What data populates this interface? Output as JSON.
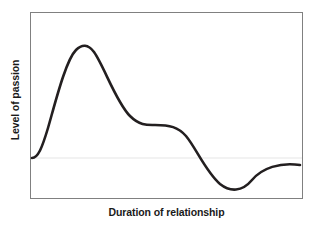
{
  "chart_data": {
    "type": "line",
    "title": "",
    "subtitle": "",
    "xlabel": "Duration of relationship",
    "ylabel": "Level of passion",
    "legend": [],
    "legend_position": "none",
    "grid": true,
    "gridlines": {
      "horizontal": [
        {
          "label": "",
          "value": 0,
          "y_pixel": 158,
          "color": "#e6e6e6",
          "description": "faint baseline reference line at the curve's starting level"
        }
      ],
      "vertical": []
    },
    "axes": {
      "x_ticks": [],
      "y_ticks": [],
      "x_tick_labels": [],
      "y_tick_labels": [],
      "xlim": [
        0,
        100
      ],
      "ylim": [
        -40,
        100
      ],
      "frame_color": "#808080",
      "frame_width_px": 1,
      "frame_box_px": {
        "left": 30,
        "top": 12,
        "right": 303,
        "bottom": 199
      }
    },
    "series": [
      {
        "name": "Passion",
        "color": "#231f20",
        "line_width_px": 2.6,
        "smooth": true,
        "x": [
          0,
          2,
          5,
          8,
          12,
          16,
          20,
          24,
          28,
          33,
          38,
          43,
          48,
          52,
          57,
          62,
          66,
          70,
          74,
          78,
          82,
          86,
          90,
          94,
          97,
          100
        ],
        "y": [
          0,
          6,
          22,
          45,
          68,
          84,
          93,
          96,
          94,
          87,
          76,
          63,
          51,
          42,
          35,
          32,
          32,
          30,
          22,
          8,
          -10,
          -26,
          -34,
          -30,
          -16,
          -8
        ],
        "annotations": [
          {
            "label": "start",
            "x_pixel": 32,
            "y_pixel": 158
          },
          {
            "label": "peak",
            "x_pixel": 84,
            "y_pixel": 46
          },
          {
            "label": "plateau-start",
            "x_pixel": 155,
            "y_pixel": 125
          },
          {
            "label": "plateau-end",
            "x_pixel": 195,
            "y_pixel": 126
          },
          {
            "label": "trough",
            "x_pixel": 253,
            "y_pixel": 189
          },
          {
            "label": "end",
            "x_pixel": 300,
            "y_pixel": 165
          }
        ]
      }
    ],
    "path_d": "M 2 146 C 8 146 12 136 18 116 C 26 88 36 48 46 38 C 52 32 58 32 64 40 C 74 54 86 90 100 104 C 110 114 118 113 125 113 C 140 113 148 115 156 124 C 166 136 176 160 190 172 C 200 180 212 180 222 168 C 232 156 250 150 270 153"
  },
  "colors": {
    "background": "#ffffff",
    "curve": "#231f20",
    "frame": "#808080",
    "gridline": "#e6e6e6",
    "label_text": "#1a1a1a"
  }
}
